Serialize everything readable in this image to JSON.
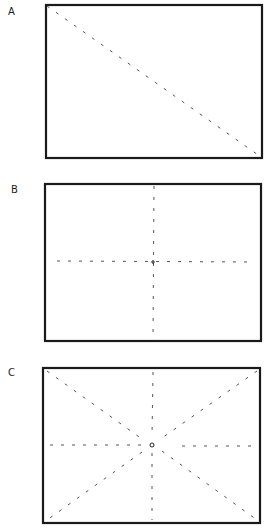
{
  "panels": [
    {
      "label": "A",
      "description": "Rectangle with single diagonal dashed line from top-left to bottom-right corner",
      "rect": {
        "x": 46,
        "y": 5,
        "w": 216,
        "h": 153
      },
      "lines": [
        {
          "x1": 47,
          "y1": 6,
          "x2": 261,
          "y2": 157
        }
      ],
      "center_marker": "none"
    },
    {
      "label": "B",
      "description": "Rectangle with horizontal and vertical dashed center lines crossing at a small plus mark",
      "rect": {
        "x": 45,
        "y": 184,
        "w": 216,
        "h": 157
      },
      "lines": [
        {
          "x1": 154,
          "y1": 186,
          "x2": 153,
          "y2": 340
        },
        {
          "x1": 57,
          "y1": 261,
          "x2": 254,
          "y2": 262
        }
      ],
      "center_marker": "plus",
      "center": {
        "x": 153,
        "y": 262
      }
    },
    {
      "label": "C",
      "description": "Rectangle with both diagonals, horizontal and vertical dashed lines radiating from a small central circle",
      "rect": {
        "x": 43,
        "y": 368,
        "w": 217,
        "h": 155
      },
      "lines": [
        {
          "x1": 47,
          "y1": 371,
          "x2": 142,
          "y2": 439
        },
        {
          "x1": 162,
          "y1": 451,
          "x2": 257,
          "y2": 520
        },
        {
          "x1": 257,
          "y1": 371,
          "x2": 162,
          "y2": 438
        },
        {
          "x1": 142,
          "y1": 452,
          "x2": 47,
          "y2": 520
        },
        {
          "x1": 153,
          "y1": 372,
          "x2": 152,
          "y2": 437
        },
        {
          "x1": 152,
          "y1": 453,
          "x2": 152,
          "y2": 520
        },
        {
          "x1": 50,
          "y1": 445,
          "x2": 142,
          "y2": 445
        },
        {
          "x1": 182,
          "y1": 446,
          "x2": 255,
          "y2": 446
        }
      ],
      "center_marker": "circle",
      "center": {
        "x": 152,
        "y": 445
      }
    }
  ],
  "colors": {
    "frame": "#1a1a1a",
    "dash": "#555555",
    "label": "#222222"
  }
}
